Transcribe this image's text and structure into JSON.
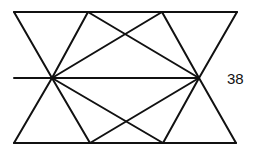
{
  "diagram": {
    "stroke_color": "#111111",
    "stroke_width": 2,
    "label": "38",
    "points": {
      "top_left": [
        14,
        12
      ],
      "top_right": [
        237,
        12
      ],
      "bottom_left": [
        14,
        143
      ],
      "bottom_right": [
        236,
        143
      ],
      "mid_left_start": [
        14,
        78
      ],
      "left_vertex": [
        52,
        78
      ],
      "right_vertex": [
        199,
        78
      ],
      "top_inner_left": [
        88,
        12
      ],
      "top_inner_right": [
        162,
        12
      ],
      "bottom_inner_left": [
        90,
        143
      ],
      "bottom_inner_right": [
        163,
        143
      ]
    },
    "segments": [
      {
        "name": "top-edge",
        "from": "top_left",
        "to": "top_right"
      },
      {
        "name": "bottom-edge",
        "from": "bottom_left",
        "to": "bottom_right"
      },
      {
        "name": "mid-horizontal",
        "from": "mid_left_start",
        "to": "right_vertex"
      },
      {
        "name": "left-upper-outer",
        "from": "top_left",
        "to": "left_vertex"
      },
      {
        "name": "left-lower-outer",
        "from": "left_vertex",
        "to": "bottom_left"
      },
      {
        "name": "right-upper-outer",
        "from": "top_right",
        "to": "right_vertex"
      },
      {
        "name": "right-lower-outer",
        "from": "right_vertex",
        "to": "bottom_right"
      },
      {
        "name": "left-to-top-inner-left",
        "from": "left_vertex",
        "to": "top_inner_left"
      },
      {
        "name": "left-to-top-inner-right",
        "from": "left_vertex",
        "to": "top_inner_right"
      },
      {
        "name": "left-to-bottom-inner-left",
        "from": "left_vertex",
        "to": "bottom_inner_left"
      },
      {
        "name": "left-to-bottom-inner-right",
        "from": "left_vertex",
        "to": "bottom_inner_right"
      },
      {
        "name": "right-to-top-inner-left",
        "from": "right_vertex",
        "to": "top_inner_left"
      },
      {
        "name": "right-to-top-inner-right",
        "from": "right_vertex",
        "to": "top_inner_right"
      },
      {
        "name": "right-to-bottom-inner-left",
        "from": "right_vertex",
        "to": "bottom_inner_left"
      },
      {
        "name": "right-to-bottom-inner-right",
        "from": "right_vertex",
        "to": "bottom_inner_right"
      }
    ]
  }
}
